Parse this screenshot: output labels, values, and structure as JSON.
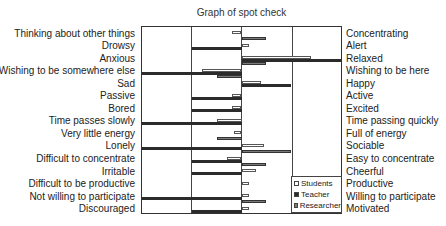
{
  "chart_data": {
    "type": "bar",
    "orientation": "horizontal-diverging",
    "title": "Graph of spot check",
    "xlabel": "",
    "ylabel": "",
    "xlim": [
      -2,
      2
    ],
    "grid": true,
    "gridlines_x": [
      -1,
      0,
      1
    ],
    "legend_position": "lower right inside",
    "left_labels": [
      "Thinking about other things",
      "Drowsy",
      "Anxious",
      "Wishing to be somewhere else",
      "Sad",
      "Passive",
      "Bored",
      "Time passes slowly",
      "Very little energy",
      "Lonely",
      "Difficult to concentrate",
      "Irritable",
      "Difficult to be productive",
      "Not willing to participate",
      "Discouraged"
    ],
    "right_labels": [
      "Concentrating",
      "Alert",
      "Relaxed",
      "Wishing to be here",
      "Happy",
      "Active",
      "Excited",
      "Time passing quickly",
      "Full of energy",
      "Sociable",
      "Easy to concentrate",
      "Cheerful",
      "Productive",
      "Willing to participate",
      "Motivated"
    ],
    "series": [
      {
        "name": "Students",
        "style": "white",
        "values": [
          -0.2,
          0.15,
          1.4,
          -0.8,
          0.4,
          -0.2,
          -0.2,
          -0.5,
          -0.15,
          0.45,
          -0.3,
          0.3,
          0.15,
          0.15,
          0.15
        ]
      },
      {
        "name": "Teacher",
        "style": "black",
        "values": [
          0,
          -1,
          2,
          -2,
          1,
          -1,
          -1,
          -2,
          0,
          -2,
          -1,
          -1,
          0,
          -2,
          -1
        ]
      },
      {
        "name": "Researcher",
        "style": "gray",
        "values": [
          0.5,
          0,
          0.5,
          -0.5,
          0,
          0,
          0,
          0,
          -0.5,
          1,
          0.5,
          0,
          0,
          0.5,
          0
        ]
      }
    ]
  },
  "legend": {
    "items": [
      {
        "label": "Students"
      },
      {
        "label": "Teacher"
      },
      {
        "label": "Researcher"
      }
    ]
  }
}
